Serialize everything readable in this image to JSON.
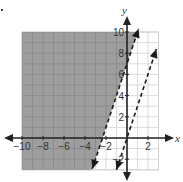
{
  "chart_data": {
    "type": "line",
    "title": "",
    "xlabel": "x",
    "ylabel": "y",
    "xlim": [
      -10,
      3
    ],
    "ylim": [
      -3,
      10
    ],
    "grid": true,
    "grid_step": 1,
    "x_ticks": [
      -10,
      -8,
      -6,
      -4,
      -2,
      2
    ],
    "x_tick_labels": [
      "−10",
      "−8",
      "−6",
      "−4",
      "−2",
      "2"
    ],
    "y_ticks": [
      -2,
      2,
      4,
      6,
      8,
      10
    ],
    "y_tick_labels": [
      "−2",
      "2",
      "4",
      "6",
      "8",
      "10"
    ],
    "series": [
      {
        "name": "boundary line 1",
        "equation": "y = 3x + 7",
        "slope": 3,
        "intercept": 7,
        "style": "dashed",
        "x_range": [
          -3.3,
          1.1
        ]
      },
      {
        "name": "boundary line 2",
        "equation": "y = 3x",
        "slope": 3,
        "intercept": 0,
        "style": "dashed",
        "x_range": [
          -1.0,
          2.8
        ]
      }
    ],
    "shaded_region": {
      "description": "left of line 1",
      "inequality": "y > 3x + 7",
      "color": "#9e9e9e"
    }
  },
  "colors": {
    "shade": "#9e9e9e",
    "shade_grid": "#888888",
    "grid": "#d2d2d2",
    "axis": "#222222",
    "line": "#1a1a1a"
  },
  "labels": {
    "x_axis": "x",
    "y_axis": "y"
  }
}
